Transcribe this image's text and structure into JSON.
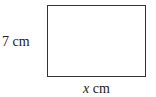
{
  "diagram": {
    "shape": "rectangle",
    "height_label": "7 cm",
    "width_label": {
      "variable": "x",
      "unit": " cm"
    }
  }
}
